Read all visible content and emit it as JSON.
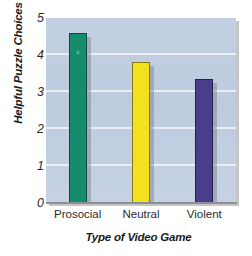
{
  "chart_data": {
    "type": "bar",
    "title": "",
    "xlabel": "Type of Video Game",
    "ylabel": "Helpful Puzzle Choices",
    "categories": [
      "Prosocial",
      "Neutral",
      "Violent"
    ],
    "values": [
      4.6,
      3.8,
      3.35
    ],
    "series": [
      {
        "name": "Helpful Puzzle Choices",
        "values": [
          4.6,
          3.8,
          3.35
        ]
      }
    ],
    "bar_colors": [
      "#168c6c",
      "#f3e01e",
      "#4a3d8c"
    ],
    "ylim": [
      0,
      5
    ],
    "yticks": [
      0,
      1,
      2,
      3,
      4,
      5
    ],
    "ytick_labels": [
      "0",
      "1",
      "2",
      "3",
      "4",
      "5"
    ],
    "grid": true,
    "grid_color": "#eef2f8",
    "legend": "none",
    "plot_background": "#c0cee1",
    "annotations": [
      {
        "text": "c",
        "bar": "Prosocial"
      }
    ]
  }
}
